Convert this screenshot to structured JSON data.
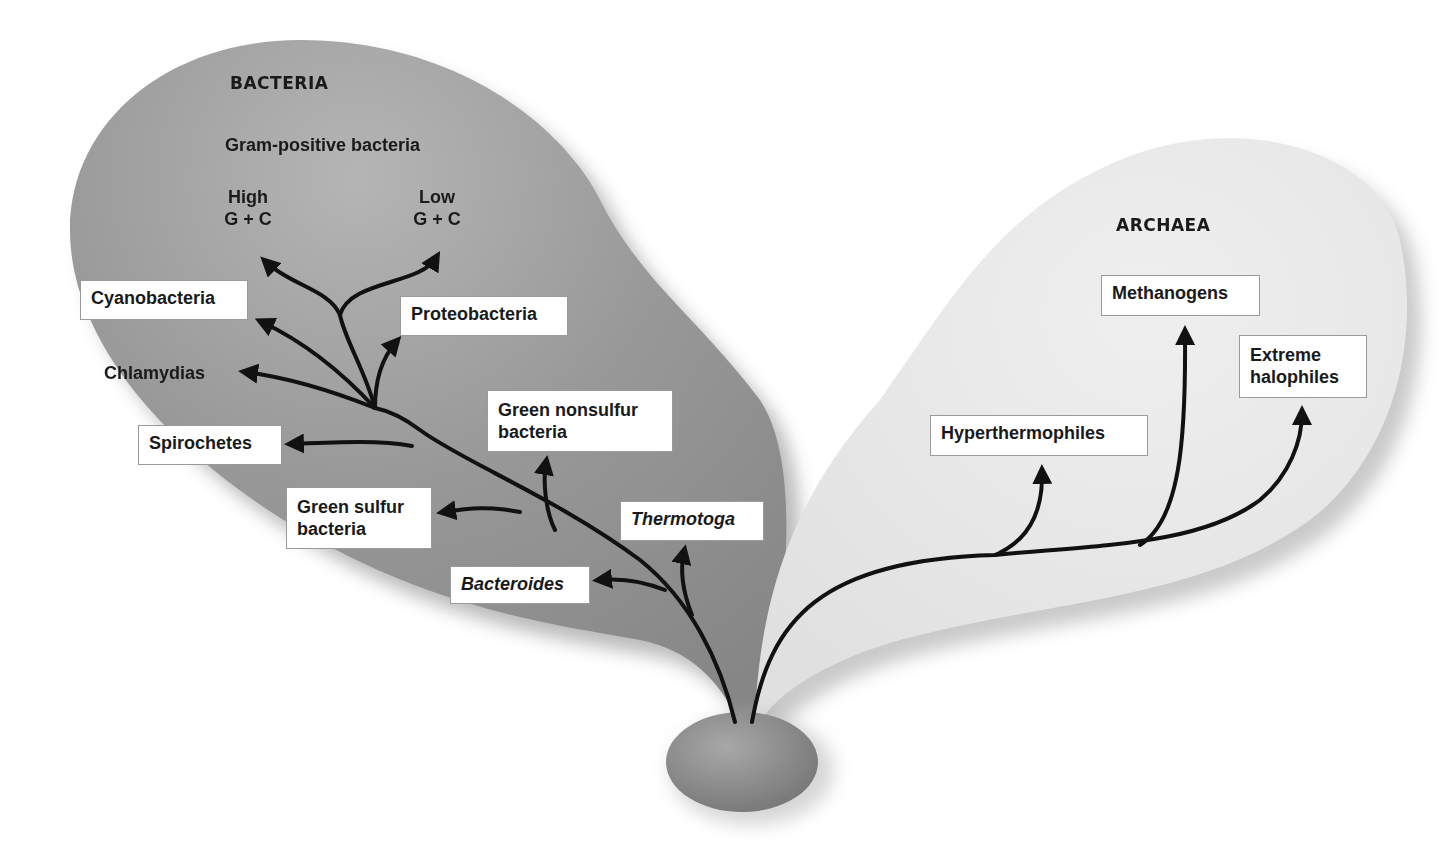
{
  "diagram": {
    "type": "phylogenetic-tree",
    "colors": {
      "bacteria_region": "#8f8f8f",
      "archaea_region": "#e6e6e6",
      "root": "#8a8a8a",
      "branch": "#111111",
      "label_box": "#ffffff"
    },
    "bacteria": {
      "title": "BACTERIA",
      "gram_positive_label": "Gram-positive bacteria",
      "high_gc": {
        "line1": "High",
        "line2": "G + C"
      },
      "low_gc": {
        "line1": "Low",
        "line2": "G + C"
      },
      "groups": {
        "cyanobacteria": "Cyanobacteria",
        "proteobacteria": "Proteobacteria",
        "chlamydias": "Chlamydias",
        "spirochetes": "Spirochetes",
        "green_nonsulfur": {
          "line1": "Green nonsulfur",
          "line2": "bacteria"
        },
        "green_sulfur": {
          "line1": "Green sulfur",
          "line2": "bacteria"
        },
        "thermotoga": "Thermotoga",
        "bacteroides": "Bacteroides"
      }
    },
    "archaea": {
      "title": "ARCHAEA",
      "groups": {
        "methanogens": "Methanogens",
        "extreme_halophiles": {
          "line1": "Extreme",
          "line2": "halophiles"
        },
        "hyperthermophiles": "Hyperthermophiles"
      }
    }
  }
}
